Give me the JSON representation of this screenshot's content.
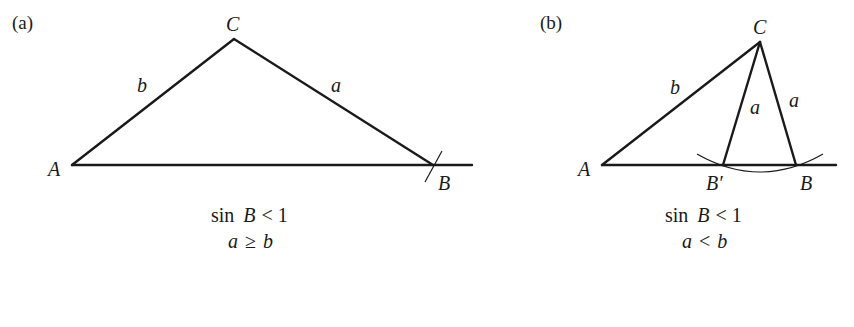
{
  "panels": [
    {
      "tag": "(a)",
      "vertices": {
        "A": "A",
        "B": "B",
        "C": "C"
      },
      "sides": {
        "b": "b",
        "a": "a"
      },
      "caption": {
        "line1_fn": "sin",
        "line1_var": "B",
        "line1_rel": "< 1",
        "line2_a": "a",
        "line2_rel": "≥",
        "line2_b": "b"
      }
    },
    {
      "tag": "(b)",
      "vertices": {
        "A": "A",
        "B_prime": "B′",
        "B": "B",
        "C": "C"
      },
      "sides": {
        "b": "b",
        "a1": "a",
        "a2": "a"
      },
      "caption": {
        "line1_fn": "sin",
        "line1_var": "B",
        "line1_rel": "< 1",
        "line2_a": "a",
        "line2_rel": "<",
        "line2_b": "b"
      }
    }
  ]
}
